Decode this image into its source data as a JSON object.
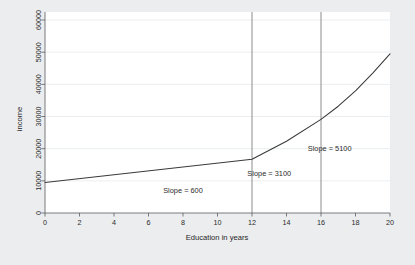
{
  "chart_data": {
    "type": "line",
    "title": "",
    "xlabel": "Education in years",
    "ylabel": "income",
    "xlim": [
      0,
      20
    ],
    "ylim": [
      0,
      62500
    ],
    "grid": true,
    "legend": "none",
    "x_ticks": [
      0,
      2,
      4,
      6,
      8,
      10,
      12,
      14,
      16,
      18,
      20
    ],
    "x_tick_labels": [
      "0",
      "2",
      "4",
      "6",
      "8",
      "10",
      "12",
      "14",
      "16",
      "18",
      "20"
    ],
    "y_ticks": [
      0,
      10000,
      20000,
      30000,
      40000,
      50000,
      60000
    ],
    "y_tick_labels": [
      "0",
      "10000",
      "20000",
      "30000",
      "40000",
      "50000",
      "60000"
    ],
    "series": [
      {
        "name": "income",
        "x": [
          0,
          12,
          14,
          16,
          17,
          18,
          19,
          20
        ],
        "values": [
          9500,
          16700,
          22300,
          29100,
          33200,
          38000,
          43500,
          49500
        ]
      }
    ],
    "reference_lines": [
      {
        "name": "high-school-line",
        "x": 12
      },
      {
        "name": "college-line",
        "x": 16
      }
    ],
    "annotations": [
      {
        "name": "slope-600",
        "text": "Slope = 600",
        "x": 8.0,
        "y": 6200,
        "value": 600
      },
      {
        "name": "slope-3100",
        "text": "Slope = 3100",
        "x": 13.0,
        "y": 11500,
        "value": 3100
      },
      {
        "name": "slope-5100",
        "text": "Slope = 5100",
        "x": 16.5,
        "y": 19200,
        "value": 5100
      }
    ],
    "colors": {
      "background": "#ecedef",
      "plot_background": "#ffffff",
      "line": "#3a3a3a",
      "gridline": "#e3e6ea",
      "axis": "#5a5a5a",
      "reference_line": "#8c8c8c",
      "text": "#2b2b2b"
    }
  }
}
